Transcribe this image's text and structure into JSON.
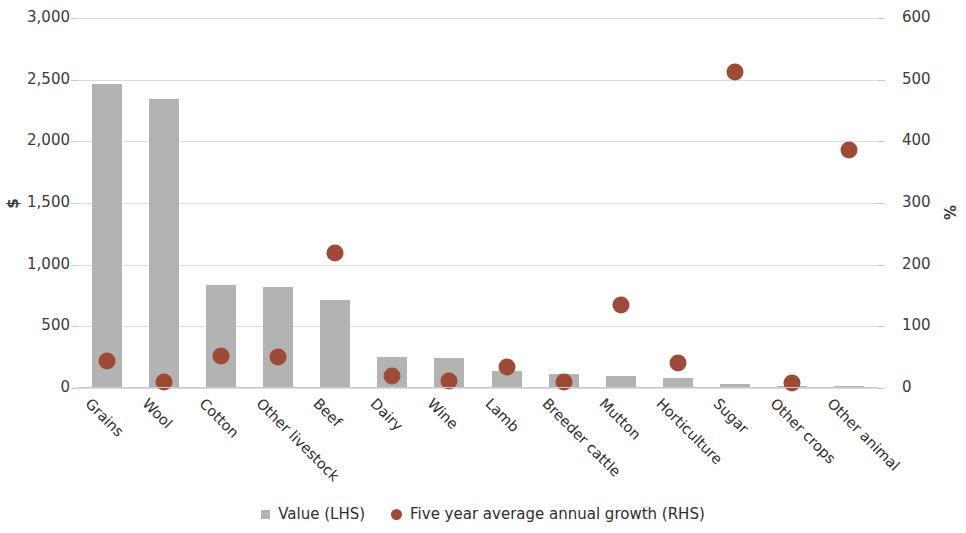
{
  "chart_data": {
    "type": "bar",
    "title": "",
    "subtitle": "",
    "xlabel": "",
    "ylabel": "$",
    "y2label": "%",
    "grid": true,
    "legend_position": "bottom",
    "ylim": [
      0,
      3000
    ],
    "y2lim": [
      0,
      600
    ],
    "yticks": [
      "0",
      "500",
      "1,000",
      "1,500",
      "2,000",
      "2,500",
      "3,000"
    ],
    "ytick_values": [
      0,
      500,
      1000,
      1500,
      2000,
      2500,
      3000
    ],
    "y2ticks": [
      "0",
      "100",
      "200",
      "300",
      "400",
      "500",
      "600"
    ],
    "y2tick_values": [
      0,
      100,
      200,
      300,
      400,
      500,
      600
    ],
    "categories": [
      "Grains",
      "Wool",
      "Cotton",
      "Other livestock",
      "Beef",
      "Dairy",
      "Wine",
      "Lamb",
      "Breeder cattle",
      "Mutton",
      "Horticulture",
      "Sugar",
      "Other crops",
      "Other animal"
    ],
    "series": [
      {
        "name": "Value (LHS)",
        "type": "bar",
        "axis": "left",
        "unit": "$",
        "color": "#b3b3b3",
        "marker": "square",
        "values": [
          2465,
          2340,
          835,
          815,
          710,
          250,
          240,
          135,
          110,
          95,
          80,
          35,
          18,
          6
        ]
      },
      {
        "name": "Five year average annual growth (RHS)",
        "type": "scatter",
        "axis": "right",
        "unit": "%",
        "color": "#9e4a37",
        "marker": "circle",
        "values": [
          44,
          9,
          52,
          51,
          219,
          19,
          12,
          34,
          9,
          135,
          41,
          512,
          8,
          386
        ]
      }
    ]
  },
  "legend": {
    "items": [
      {
        "label": "Value (LHS)",
        "marker": "square",
        "color": "#b3b3b3"
      },
      {
        "label": "Five year average annual growth (RHS)",
        "marker": "circle",
        "color": "#9e4a37"
      }
    ]
  },
  "colors": {
    "bar": "#b3b3b3",
    "dot": "#9e4a37",
    "grid": "#dcdcdc",
    "text": "#3b3b3b",
    "background": "#ffffff"
  }
}
